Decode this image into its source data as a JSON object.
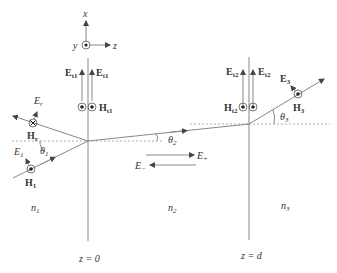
{
  "diagram": {
    "type": "multilayer-refraction",
    "axes": {
      "x": "x",
      "y": "y",
      "z": "z"
    },
    "media": [
      {
        "label": "n",
        "sub": "1"
      },
      {
        "label": "n",
        "sub": "2"
      },
      {
        "label": "n",
        "sub": "3"
      }
    ],
    "interfaces": [
      {
        "label": "z = 0"
      },
      {
        "label": "z = d"
      }
    ],
    "incident": {
      "E": "E",
      "E_sub": "1",
      "H": "H",
      "H_sub": "1",
      "angle": "θ",
      "angle_sub": "1"
    },
    "reflected": {
      "E": "E",
      "E_sub": "r",
      "H": "H",
      "H_sub": "r"
    },
    "interface1_fields": {
      "E": "E",
      "E_sub": "t1",
      "H": "H",
      "H_sub": "t1"
    },
    "layer2": {
      "angle": "θ",
      "angle_sub": "2",
      "Eplus": "E",
      "Eplus_sub": "+",
      "Eminus": "E",
      "Eminus_sub": "−"
    },
    "interface2_fields": {
      "E": "E",
      "E_sub": "t2",
      "H": "H",
      "H_sub": "t2"
    },
    "transmitted": {
      "E": "E",
      "E_sub": "3",
      "H": "H",
      "H_sub": "3",
      "angle": "θ",
      "angle_sub": "3"
    },
    "colors": {
      "line": "#888888",
      "text": "#333333",
      "dash": "#999999"
    }
  }
}
